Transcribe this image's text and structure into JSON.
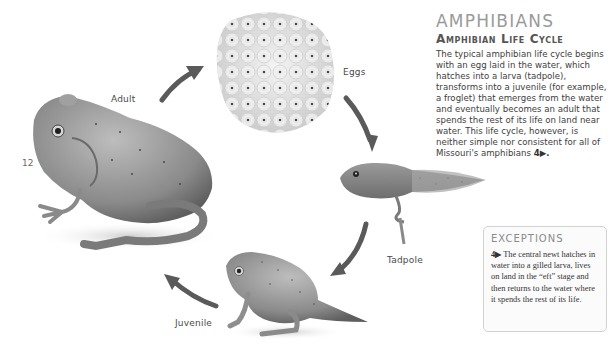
{
  "page": {
    "number": "12"
  },
  "header": {
    "section_title": "AMPHIBIANS",
    "subsection_title": "Amphibian Life Cycle"
  },
  "intro": {
    "text": "The typical amphibian life cycle begins with an egg laid in the water, which hatches into a larva (tadpole), transforms into a juvenile (for example, a froglet) that emerges from the water and eventually becomes an adult that spends the rest of its life on land near water. This life cycle, however, is neither simple nor consistent for all of Missouri's amphibians",
    "reference_marker": "4▶."
  },
  "diagram": {
    "title": "Amphibian Life Cycle",
    "stages": [
      {
        "id": "eggs",
        "label": "Eggs"
      },
      {
        "id": "tadpole",
        "label": "Tadpole"
      },
      {
        "id": "juvenile",
        "label": "Juvenile"
      },
      {
        "id": "adult",
        "label": "Adult"
      }
    ],
    "arrow_color": "#5a5a5a"
  },
  "exceptions": {
    "title": "EXCEPTIONS",
    "marker": "4▶",
    "text": " The central newt hatches in water into a gilled larva, lives on land in the “eft” stage and then returns to the water where it spends the rest of its life."
  }
}
